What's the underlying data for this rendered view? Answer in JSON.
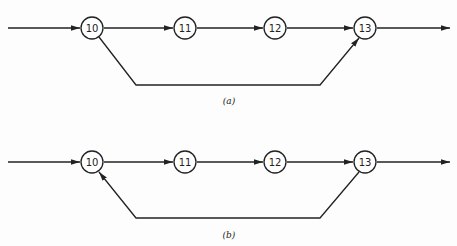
{
  "header_fragment": "",
  "diagrams": [
    {
      "id": "a",
      "caption": "(a)",
      "nodes": [
        "10",
        "11",
        "12",
        "13"
      ],
      "bypass": {
        "from": "10",
        "to": "13",
        "direction": "forward"
      }
    },
    {
      "id": "b",
      "caption": "(b)",
      "nodes": [
        "10",
        "11",
        "12",
        "13"
      ],
      "bypass": {
        "from": "13",
        "to": "10",
        "direction": "backward"
      }
    }
  ]
}
